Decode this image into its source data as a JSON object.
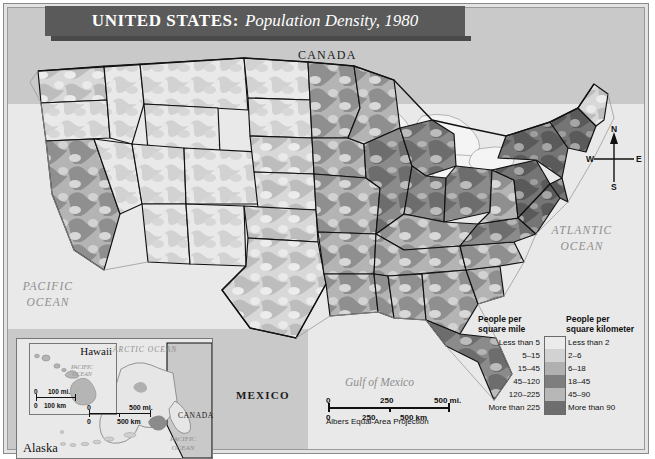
{
  "title": {
    "main": "UNITED STATES:",
    "subtitle": "Population Density, 1980"
  },
  "labels": {
    "canada": "CANADA",
    "mexico": "MEXICO",
    "atlantic_ocean_line1": "ATLANTIC",
    "atlantic_ocean_line2": "OCEAN",
    "pacific_ocean_line1": "PACIFIC",
    "pacific_ocean_line2": "OCEAN",
    "gulf_of_mexico": "Gulf of Mexico",
    "arctic_ocean": "ARCTIC  OCEAN",
    "alaska_pacific_line1": "PACIFIC",
    "alaska_pacific_line2": "OCEAN",
    "alaska": "Alaska",
    "hawaii": "Hawaii",
    "hawaii_pacific_line1": "PACIFIC",
    "hawaii_pacific_line2": "OCEAN",
    "inset_canada": "CANADA"
  },
  "compass": {
    "north": "N",
    "east": "E",
    "south": "S",
    "west": "W"
  },
  "scale_main": {
    "projection": "Albers Equal-Area Projection",
    "miles": [
      "0",
      "250",
      "500 mi."
    ],
    "kilometers": [
      "0",
      "250",
      "500 km"
    ]
  },
  "scale_alaska": {
    "miles": [
      "0",
      "500 mi."
    ],
    "kilometers": [
      "0",
      "500 km"
    ]
  },
  "scale_hawaii": {
    "miles": [
      "0",
      "100 mi."
    ],
    "kilometers": [
      "0",
      "100 km"
    ]
  },
  "legend": {
    "header_mile": "People per\nsquare mile",
    "header_mile_line1": "People per",
    "header_mile_line2": "square mile",
    "header_km_line1": "People per",
    "header_km_line2": "square kilometer",
    "rows": [
      {
        "mile": "Less than 5",
        "km": "Less than 2",
        "color": "#ebebeb"
      },
      {
        "mile": "5–15",
        "km": "2–6",
        "color": "#d2d2d2"
      },
      {
        "mile": "15–45",
        "km": "6–18",
        "color": "#b0b0b0"
      },
      {
        "mile": "45–120",
        "km": "18–45",
        "color": "#7e7e7e"
      },
      {
        "mile": "120–225",
        "km": "45–90",
        "color": "#b7b7b7"
      },
      {
        "mile": "More than 225",
        "km": "More than 90",
        "color": "#6e6e6e"
      }
    ]
  },
  "chart_data": {
    "type": "map",
    "map_kind": "choropleth",
    "title": "UNITED STATES: Population Density, 1980",
    "region": "United States (conterminous, plus Alaska and Hawaii insets)",
    "projection": "Albers Equal-Area Projection",
    "variable": "Population density",
    "units_primary": "people per square mile",
    "units_secondary": "people per square kilometer",
    "classes": [
      {
        "label_mile": "Less than 5",
        "label_km": "Less than 2",
        "min_mile": 0,
        "max_mile": 5,
        "color": "#ebebeb"
      },
      {
        "label_mile": "5-15",
        "label_km": "2-6",
        "min_mile": 5,
        "max_mile": 15,
        "color": "#d2d2d2"
      },
      {
        "label_mile": "15-45",
        "label_km": "6-18",
        "min_mile": 15,
        "max_mile": 45,
        "color": "#b0b0b0"
      },
      {
        "label_mile": "45-120",
        "label_km": "18-45",
        "min_mile": 45,
        "max_mile": 120,
        "color": "#7e7e7e"
      },
      {
        "label_mile": "120-225",
        "label_km": "45-90",
        "min_mile": 120,
        "max_mile": 225,
        "color": "#b7b7b7"
      },
      {
        "label_mile": "More than 225",
        "label_km": "More than 90",
        "min_mile": 225,
        "max_mile": null,
        "color": "#6e6e6e"
      }
    ],
    "scale_bar_miles": [
      0,
      250,
      500
    ],
    "scale_bar_km": [
      0,
      250,
      500
    ],
    "inset_scale_alaska_miles": [
      0,
      500
    ],
    "inset_scale_alaska_km": [
      0,
      500
    ],
    "inset_scale_hawaii_miles": [
      0,
      100
    ],
    "inset_scale_hawaii_km": [
      0,
      100
    ],
    "neighbors_labeled": [
      "CANADA",
      "MEXICO"
    ],
    "water_bodies_labeled": [
      "ATLANTIC OCEAN",
      "PACIFIC OCEAN",
      "Gulf of Mexico",
      "ARCTIC OCEAN"
    ],
    "regional_pattern_notes": [
      "Mountain West and Great Basin states are predominantly in the two lightest classes (under 15 per sq mi)",
      "Great Plains show a mix of the lightest and second-lightest classes",
      "Midwest and Mississippi Valley are mid-tone (15-45 per sq mi) with mottled higher pockets",
      "Northeast corridor from Washington through Boston is the darkest class (more than 225 per sq mi)",
      "Coastal California and Florida peninsula show extensive dark high-density patches",
      "Appalachian and Southeast states are mid to upper-mid classes"
    ]
  }
}
